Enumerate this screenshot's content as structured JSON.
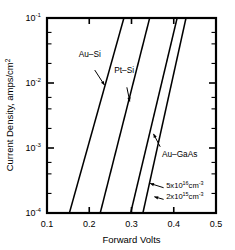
{
  "chart_data": {
    "type": "line",
    "title": "",
    "xlabel": "Forward Volts",
    "ylabel": "Current Density, amps/cm2",
    "ylabel_display": "Current Density, amps/cm",
    "ylabel_sup": "2",
    "xlim": [
      0.1,
      0.5
    ],
    "ylim": [
      0.0001,
      0.1
    ],
    "yscale": "log",
    "xscale": "linear",
    "grid": false,
    "legend": "none (inline annotations with leader arrows)",
    "xticks": [
      "0.1",
      "0.2",
      "0.3",
      "0.4",
      "0.5"
    ],
    "xtick_values": [
      0.1,
      0.2,
      0.3,
      0.4,
      0.5
    ],
    "yticks": [
      "10-1",
      "10-2",
      "10-3",
      "10-4"
    ],
    "ytick_values": [
      0.1,
      0.01,
      0.001,
      0.0001
    ],
    "ytick_mantissa": "10",
    "ytick_exponents": [
      "-1",
      "-2",
      "-3",
      "-4"
    ],
    "minor_ticks": "log decades, y-axis only",
    "series": [
      {
        "name": "Au-Si",
        "label": "Au–Si",
        "points": [
          [
            0.153,
            0.0001
          ],
          [
            0.282,
            0.1
          ]
        ]
      },
      {
        "name": "Pt-Si",
        "label": "Pt–Si",
        "points": [
          [
            0.226,
            0.0001
          ],
          [
            0.343,
            0.1
          ]
        ]
      },
      {
        "name": "Au-GaAs 5x10^16 cm-3",
        "label": "5x10¹⁶cm⁻³",
        "points": [
          [
            0.298,
            0.0001
          ],
          [
            0.408,
            0.1
          ]
        ]
      },
      {
        "name": "Au-GaAs 2x10^15 cm-3",
        "label": "2x10¹⁵cm⁻³",
        "points": [
          [
            0.327,
            0.0001
          ],
          [
            0.429,
            0.1
          ]
        ]
      }
    ],
    "annotations": [
      {
        "name": "au-si",
        "text": "Au–Si",
        "text_x": 0.175,
        "text_y": 0.0255,
        "arrow_to_x": 0.236,
        "arrow_to_y": 0.0093
      },
      {
        "name": "pt-si",
        "text": "Pt–Si",
        "text_x": 0.259,
        "text_y": 0.0143,
        "arrow_to_x": 0.296,
        "arrow_to_y": 0.0052
      },
      {
        "name": "au-gaas",
        "text": "Au–GaAs",
        "text_x": 0.372,
        "text_y": 0.00072,
        "arrow_to_x": 0.352,
        "arrow_to_y": 0.00165
      },
      {
        "name": "doping-5e16",
        "text_main": "5x10",
        "text_sup": "16",
        "text_tail": "cm",
        "text_tail_sup": "-3",
        "full": "5x10¹⁶cm⁻³",
        "text_x": 0.382,
        "text_y": 0.000245,
        "arrow_to_x": 0.344,
        "arrow_to_y": 0.000285
      },
      {
        "name": "doping-2e15",
        "text_main": "2x10",
        "text_sup": "15",
        "text_tail": "cm",
        "text_tail_sup": "-3",
        "full": "2x10¹⁵cm⁻³",
        "text_x": 0.382,
        "text_y": 0.000162,
        "arrow_to_x": 0.354,
        "arrow_to_y": 0.000178
      }
    ],
    "colors": {
      "curve": "#000000",
      "axis": "#000000",
      "background": "#ffffff",
      "text": "#000000"
    }
  }
}
